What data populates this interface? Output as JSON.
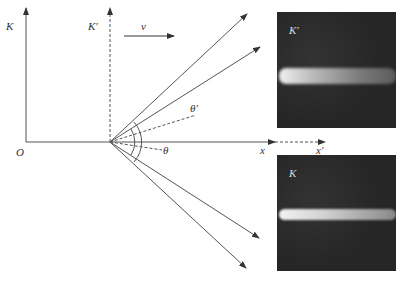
{
  "diagram": {
    "labels": {
      "frame_K": "K",
      "frame_K_prime": "K'",
      "velocity": "v",
      "origin": "O",
      "x_axis": "x",
      "x_prime_axis": "x'",
      "theta": "θ",
      "theta_prime": "θ'"
    },
    "photos": [
      {
        "label": "K'",
        "description": "light cone/beam in moving frame, wider spread"
      },
      {
        "label": "K",
        "description": "light beam in rest frame, narrower spread"
      }
    ],
    "colors": {
      "line": "#555555",
      "photo_bg": "#2a2a2a",
      "beam": "#d8d8d8"
    }
  }
}
